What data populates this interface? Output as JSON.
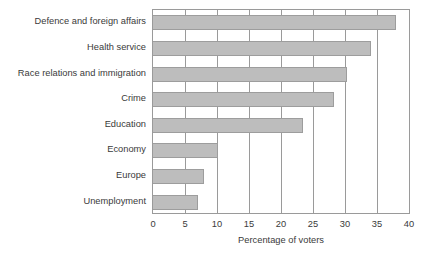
{
  "chart_data": {
    "type": "bar",
    "orientation": "horizontal",
    "title": "",
    "xlabel": "Percentage of voters",
    "ylabel": "",
    "xlim": [
      0,
      40
    ],
    "xticks": [
      "0",
      "5",
      "10",
      "15",
      "20",
      "25",
      "30",
      "35",
      "40"
    ],
    "grid": true,
    "legend": false,
    "categories": [
      "Defence and foreign affairs",
      "Health service",
      "Race relations and immigration",
      "Crime",
      "Education",
      "Economy",
      "Europe",
      "Unemployment"
    ],
    "values": [
      38,
      34,
      30.3,
      28.3,
      23.4,
      10.2,
      8,
      7
    ],
    "bar_color": "#bdbdbd",
    "bar_edge_color": "#9d9d9d",
    "axis_color": "#9a9a9a",
    "text_color": "#3a3a3a",
    "background": "#ffffff"
  }
}
